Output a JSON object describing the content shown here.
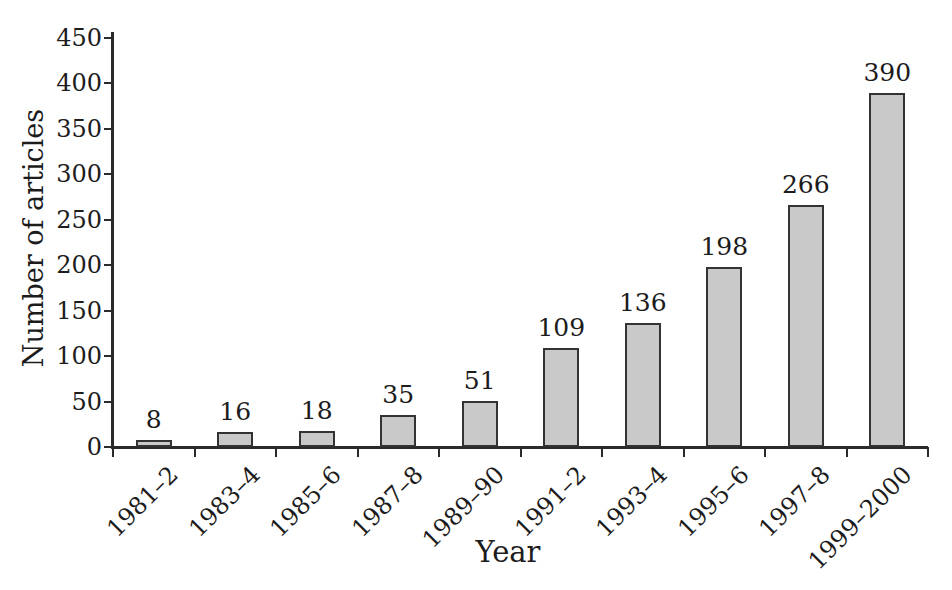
{
  "figure": {
    "background": "#ffffff",
    "text_color": "#1c1c1c",
    "axis_color": "#2a2a2a",
    "bar_fill": "#c9c9c9",
    "bar_border": "#333333"
  },
  "chart_data": {
    "type": "bar",
    "title": "",
    "xlabel": "Year",
    "ylabel": "Number of articles",
    "categories": [
      "1981–2",
      "1983–4",
      "1985–6",
      "1987–8",
      "1989–90",
      "1991–2",
      "1993–4",
      "1995–6",
      "1997–8",
      "1999–2000"
    ],
    "values": [
      8,
      16,
      18,
      35,
      51,
      109,
      136,
      198,
      266,
      390
    ],
    "bar_value_labels": [
      "8",
      "16",
      "18",
      "35",
      "51",
      "109",
      "136",
      "198",
      "266",
      "390"
    ],
    "ylim": [
      0,
      450
    ],
    "ytick_step": 50,
    "yticks": [
      0,
      50,
      100,
      150,
      200,
      250,
      300,
      350,
      400,
      450
    ],
    "grid": false,
    "legend_position": "none"
  }
}
